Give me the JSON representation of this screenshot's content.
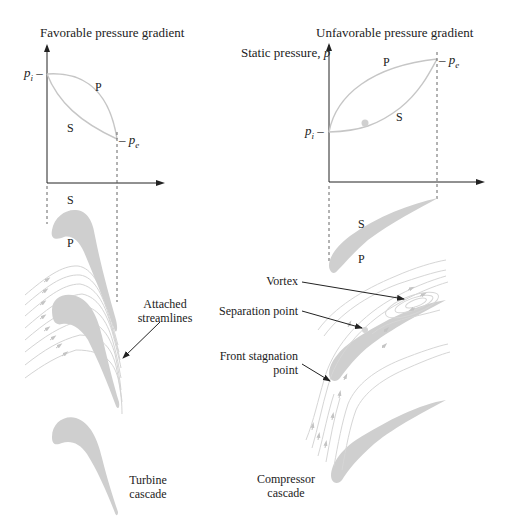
{
  "header_fragment": "p  ....  ... ..... ... .  ....  ..  ... ..... .......",
  "left_panel": {
    "title": "Favorable pressure gradient",
    "pi_label": "p_i –",
    "pe_label": "– p_e",
    "curve_P": "P",
    "curve_S": "S",
    "blade_S": "S",
    "blade_P": "P",
    "annotation": [
      "Attached",
      "streamlines"
    ],
    "caption": [
      "Turbine",
      "cascade"
    ]
  },
  "right_panel": {
    "title": "Unfavorable pressure gradient",
    "ylabel": "Static pressure, p",
    "pi_label": "p_i –",
    "pe_label": "– p_e",
    "curve_P": "P",
    "curve_S": "S",
    "blade_S": "S",
    "blade_P": "P",
    "annotations": {
      "vortex": "Vortex",
      "separation": "Separation point",
      "stagnation": [
        "Front stagnation",
        "point"
      ]
    },
    "caption": [
      "Compressor",
      "cascade"
    ]
  },
  "colors": {
    "ink": "#222222",
    "curve": "#c8c8c8",
    "blade": "#cfcfcf",
    "streamline": "#d6d6d6",
    "dashed": "#555555"
  }
}
